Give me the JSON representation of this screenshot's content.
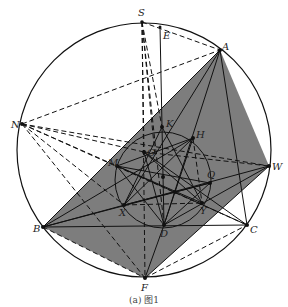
{
  "figure": {
    "caption": "(a) 图1",
    "fill_color": "#7a7a7a",
    "stroke_color": "#111111"
  },
  "points": {
    "S": "S",
    "E": "E",
    "A": "A",
    "N": "N",
    "W": "W",
    "B": "B",
    "C": "C",
    "D": "D",
    "F": "F",
    "K": "K",
    "H": "H",
    "G": "G",
    "M": "M",
    "Q": "Q",
    "X": "X",
    "Y": "Y",
    "I": "I",
    "T": "T"
  }
}
